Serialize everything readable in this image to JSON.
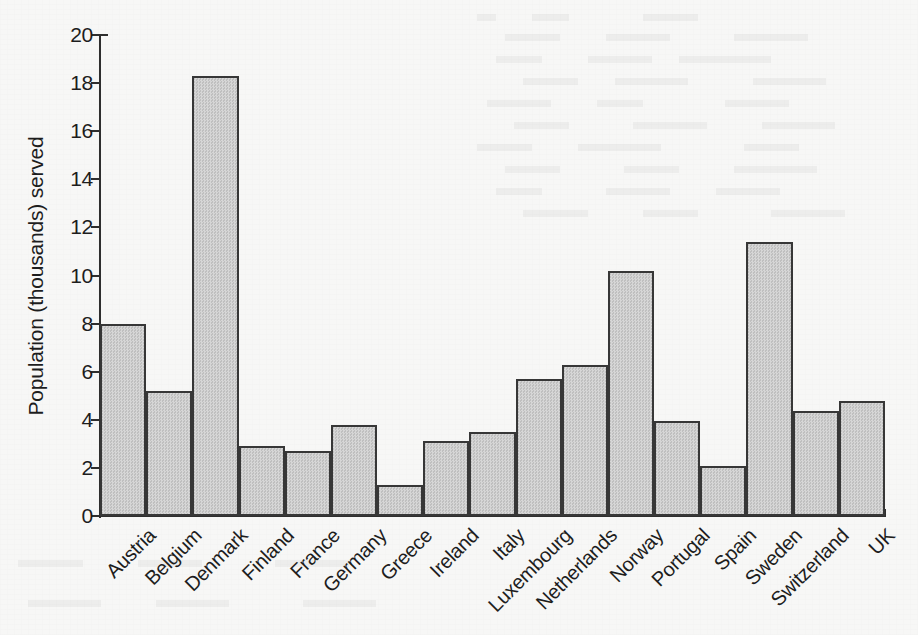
{
  "chart_data": {
    "type": "bar",
    "title": "",
    "xlabel": "",
    "ylabel": "Population (thousands) served",
    "ylim": [
      0,
      20
    ],
    "ytick_step": 2,
    "yticks": [
      20,
      18,
      16,
      14,
      12,
      10,
      8,
      6,
      4,
      2,
      0
    ],
    "grid": false,
    "legend": "none",
    "bar_fill_color": "#c9c9c9",
    "bar_edge_color": "#373737",
    "background_color": "#f7f7f6",
    "categories": [
      "Austria",
      "Belgium",
      "Denmark",
      "Finland",
      "France",
      "Germany",
      "Greece",
      "Ireland",
      "Italy",
      "Luxembourg",
      "Netherlands",
      "Norway",
      "Portugal",
      "Spain",
      "Sweden",
      "Switzerland",
      "UK"
    ],
    "values": [
      8.0,
      5.2,
      18.3,
      2.9,
      2.7,
      3.8,
      1.3,
      3.1,
      3.5,
      5.7,
      6.3,
      10.2,
      3.95,
      2.1,
      11.4,
      4.35,
      4.8
    ]
  }
}
